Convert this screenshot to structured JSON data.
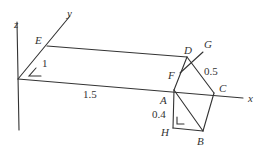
{
  "diagram": {
    "type": "3d-geometry-figure",
    "axes": {
      "x_label": "x",
      "y_label": "y",
      "z_label": "z"
    },
    "points": {
      "E": "E",
      "D": "D",
      "G": "G",
      "F": "F",
      "A": "A",
      "C": "C",
      "H": "H",
      "B": "B"
    },
    "measurements": {
      "OE": "1",
      "OA": "1.5",
      "DC": "0.5",
      "AH": "0.4"
    },
    "colors": {
      "line": "#333333",
      "background": "#ffffff"
    }
  }
}
